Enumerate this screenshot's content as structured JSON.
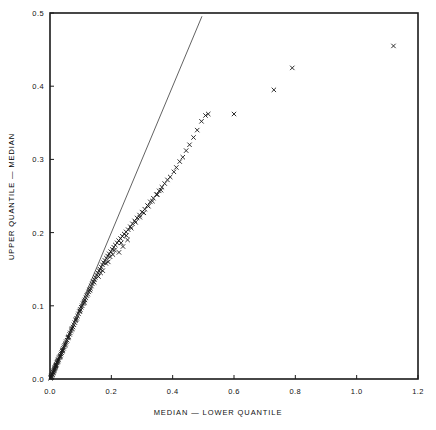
{
  "chart_data": {
    "type": "scatter",
    "title": "",
    "xlabel": "MEDIAN  —  LOWER QUANTILE",
    "ylabel": "UPPER QUANTILE  —  MEDIAN",
    "xlim": [
      0.0,
      1.2
    ],
    "ylim": [
      0.0,
      0.5
    ],
    "xticks": [
      0.0,
      0.2,
      0.4,
      0.6,
      0.8,
      1.0,
      1.2
    ],
    "xticklabels": [
      "0.0",
      "0.2",
      "0.4",
      "0.6",
      "0.8",
      "1.0",
      "1.2"
    ],
    "yticks": [
      0.0,
      0.1,
      0.2,
      0.3,
      0.4,
      0.5
    ],
    "yticklabels": [
      "0.0",
      "0.1",
      "0.2",
      "0.3",
      "0.4",
      "0.5"
    ],
    "grid": false,
    "legend": null,
    "marker": "x",
    "marker_color": "#1a1a1a",
    "frame_color": "#1a1a1a",
    "background": "#ffffff",
    "reference_line": {
      "name": "identity-line",
      "type": "line",
      "equation": "y = x",
      "x": [
        0.0,
        0.4955
      ],
      "y": [
        0.0,
        0.4955
      ],
      "color": "#3a3a3a",
      "width": 0.8
    },
    "series": [
      {
        "name": "symmetry-points",
        "points": [
          [
            0.004,
            0.004
          ],
          [
            0.006,
            0.005
          ],
          [
            0.007,
            0.007
          ],
          [
            0.009,
            0.008
          ],
          [
            0.01,
            0.01
          ],
          [
            0.011,
            0.009
          ],
          [
            0.013,
            0.012
          ],
          [
            0.014,
            0.013
          ],
          [
            0.015,
            0.014
          ],
          [
            0.016,
            0.016
          ],
          [
            0.018,
            0.017
          ],
          [
            0.019,
            0.018
          ],
          [
            0.021,
            0.02
          ],
          [
            0.022,
            0.022
          ],
          [
            0.024,
            0.023
          ],
          [
            0.025,
            0.024
          ],
          [
            0.027,
            0.026
          ],
          [
            0.028,
            0.027
          ],
          [
            0.03,
            0.029
          ],
          [
            0.032,
            0.03
          ],
          [
            0.034,
            0.032
          ],
          [
            0.036,
            0.034
          ],
          [
            0.038,
            0.036
          ],
          [
            0.04,
            0.038
          ],
          [
            0.042,
            0.04
          ],
          [
            0.044,
            0.042
          ],
          [
            0.046,
            0.044
          ],
          [
            0.048,
            0.046
          ],
          [
            0.051,
            0.049
          ],
          [
            0.053,
            0.051
          ],
          [
            0.056,
            0.053
          ],
          [
            0.058,
            0.056
          ],
          [
            0.061,
            0.058
          ],
          [
            0.064,
            0.061
          ],
          [
            0.066,
            0.063
          ],
          [
            0.069,
            0.066
          ],
          [
            0.072,
            0.069
          ],
          [
            0.075,
            0.071
          ],
          [
            0.078,
            0.074
          ],
          [
            0.081,
            0.077
          ],
          [
            0.084,
            0.08
          ],
          [
            0.087,
            0.083
          ],
          [
            0.09,
            0.086
          ],
          [
            0.093,
            0.089
          ],
          [
            0.096,
            0.092
          ],
          [
            0.099,
            0.095
          ],
          [
            0.102,
            0.098
          ],
          [
            0.105,
            0.1
          ],
          [
            0.108,
            0.103
          ],
          [
            0.111,
            0.106
          ],
          [
            0.114,
            0.108
          ],
          [
            0.117,
            0.111
          ],
          [
            0.12,
            0.114
          ],
          [
            0.123,
            0.116
          ],
          [
            0.126,
            0.119
          ],
          [
            0.129,
            0.122
          ],
          [
            0.132,
            0.124
          ],
          [
            0.135,
            0.127
          ],
          [
            0.138,
            0.13
          ],
          [
            0.141,
            0.133
          ],
          [
            0.145,
            0.136
          ],
          [
            0.148,
            0.139
          ],
          [
            0.152,
            0.142
          ],
          [
            0.156,
            0.145
          ],
          [
            0.16,
            0.148
          ],
          [
            0.163,
            0.15
          ],
          [
            0.167,
            0.153
          ],
          [
            0.171,
            0.156
          ],
          [
            0.175,
            0.159
          ],
          [
            0.179,
            0.162
          ],
          [
            0.184,
            0.165
          ],
          [
            0.188,
            0.168
          ],
          [
            0.193,
            0.171
          ],
          [
            0.198,
            0.174
          ],
          [
            0.203,
            0.177
          ],
          [
            0.208,
            0.18
          ],
          [
            0.213,
            0.183
          ],
          [
            0.219,
            0.186
          ],
          [
            0.224,
            0.189
          ],
          [
            0.23,
            0.192
          ],
          [
            0.236,
            0.195
          ],
          [
            0.242,
            0.198
          ],
          [
            0.248,
            0.201
          ],
          [
            0.255,
            0.204
          ],
          [
            0.262,
            0.208
          ],
          [
            0.269,
            0.212
          ],
          [
            0.276,
            0.216
          ],
          [
            0.284,
            0.22
          ],
          [
            0.292,
            0.224
          ],
          [
            0.3,
            0.228
          ],
          [
            0.309,
            0.232
          ],
          [
            0.318,
            0.237
          ],
          [
            0.327,
            0.242
          ],
          [
            0.337,
            0.247
          ],
          [
            0.347,
            0.252
          ],
          [
            0.356,
            0.257
          ],
          [
            0.365,
            0.262
          ],
          [
            0.374,
            0.267
          ],
          [
            0.383,
            0.272
          ],
          [
            0.249,
            0.196
          ],
          [
            0.265,
            0.206
          ],
          [
            0.279,
            0.214
          ],
          [
            0.293,
            0.221
          ],
          [
            0.306,
            0.227
          ],
          [
            0.321,
            0.236
          ],
          [
            0.334,
            0.243
          ],
          [
            0.35,
            0.252
          ],
          [
            0.362,
            0.258
          ],
          [
            0.392,
            0.276
          ],
          [
            0.404,
            0.283
          ],
          [
            0.412,
            0.289
          ],
          [
            0.423,
            0.297
          ],
          [
            0.433,
            0.303
          ],
          [
            0.444,
            0.312
          ],
          [
            0.455,
            0.32
          ],
          [
            0.468,
            0.33
          ],
          [
            0.48,
            0.34
          ],
          [
            0.494,
            0.352
          ],
          [
            0.507,
            0.36
          ],
          [
            0.516,
            0.362
          ],
          [
            0.182,
            0.158
          ],
          [
            0.196,
            0.167
          ],
          [
            0.21,
            0.176
          ],
          [
            0.232,
            0.186
          ],
          [
            0.158,
            0.14
          ],
          [
            0.172,
            0.148
          ],
          [
            0.144,
            0.132
          ],
          [
            0.13,
            0.121
          ],
          [
            0.112,
            0.104
          ],
          [
            0.098,
            0.093
          ],
          [
            0.085,
            0.081
          ],
          [
            0.071,
            0.068
          ],
          [
            0.06,
            0.057
          ],
          [
            0.05,
            0.047
          ],
          [
            0.041,
            0.039
          ],
          [
            0.033,
            0.031
          ],
          [
            0.026,
            0.025
          ],
          [
            0.02,
            0.019
          ],
          [
            0.017,
            0.015
          ],
          [
            0.012,
            0.011
          ],
          [
            0.008,
            0.006
          ],
          [
            0.005,
            0.003
          ],
          [
            0.003,
            0.002
          ],
          [
            0.002,
            0.001
          ],
          [
            0.225,
            0.173
          ],
          [
            0.238,
            0.181
          ],
          [
            0.253,
            0.19
          ],
          [
            0.165,
            0.145
          ],
          [
            0.19,
            0.16
          ],
          [
            0.205,
            0.17
          ],
          [
            0.6,
            0.362
          ],
          [
            0.73,
            0.395
          ],
          [
            0.79,
            0.425
          ],
          [
            1.12,
            0.455
          ]
        ]
      }
    ]
  },
  "axes": {
    "xlabel": "MEDIAN  —  LOWER QUANTILE",
    "ylabel": "UPPER QUANTILE  —  MEDIAN"
  }
}
